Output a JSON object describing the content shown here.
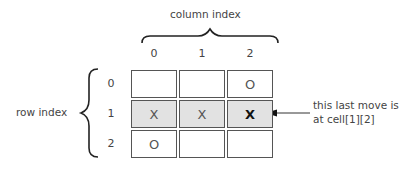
{
  "labels": {
    "column_index": "column index",
    "row_index": "row index",
    "annotation_line1": "this last move is",
    "annotation_line2": "at cell[1][2]"
  },
  "columns": [
    "0",
    "1",
    "2"
  ],
  "rows": [
    "0",
    "1",
    "2"
  ],
  "board": [
    [
      "",
      "",
      "O"
    ],
    [
      "X",
      "X",
      "X"
    ],
    [
      "O",
      "",
      ""
    ]
  ],
  "highlighted_row": 1,
  "last_move": {
    "row": 1,
    "col": 2
  },
  "colors": {
    "highlight": "#e2e2e2",
    "border": "#555555"
  }
}
